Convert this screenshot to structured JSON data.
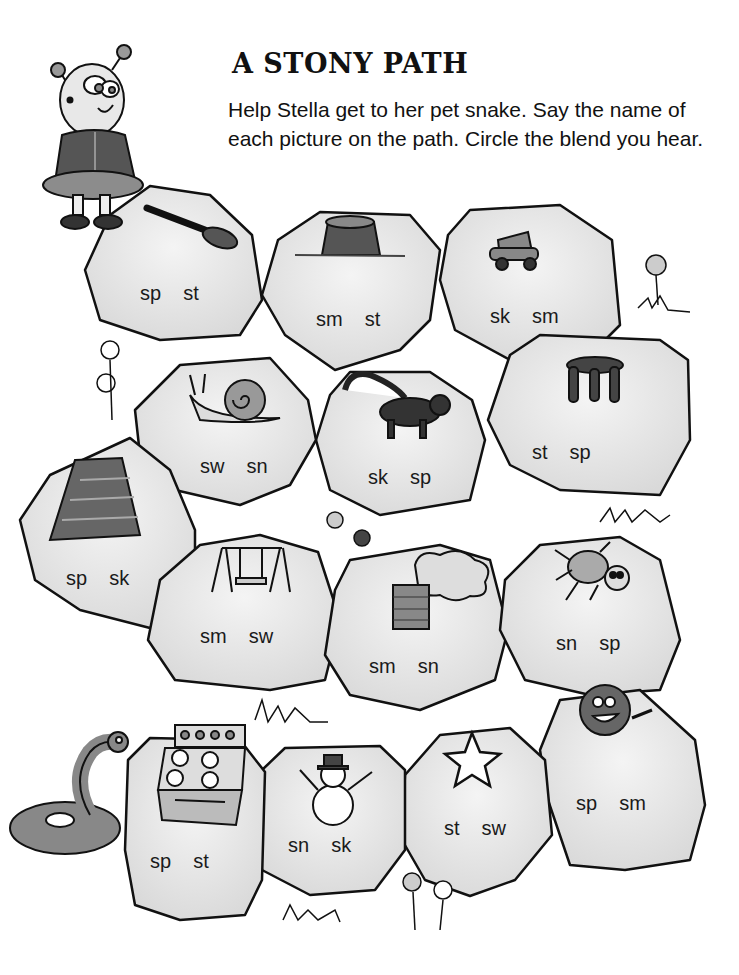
{
  "worksheet": {
    "title": "A STONY PATH",
    "instructions": "Help Stella get to her pet snake. Say the name of each picture on the path. Circle the blend you hear.",
    "characters": {
      "start": "Stella (girl with antennae)",
      "end": "snake"
    },
    "colors": {
      "stone_fill": "#e8e8e8",
      "stone_outline": "#111111",
      "picture_dark": "#4a4a4a",
      "picture_mid": "#8a8a8a",
      "background": "#ffffff"
    },
    "stones": [
      {
        "picture": "spoon",
        "choices": [
          "sp",
          "st"
        ]
      },
      {
        "picture": "stump",
        "choices": [
          "sm",
          "st"
        ]
      },
      {
        "picture": "skate",
        "choices": [
          "sk",
          "sm"
        ]
      },
      {
        "picture": "stool",
        "choices": [
          "st",
          "sp"
        ]
      },
      {
        "picture": "skunk",
        "choices": [
          "sk",
          "sp"
        ]
      },
      {
        "picture": "snail",
        "choices": [
          "sw",
          "sn"
        ]
      },
      {
        "picture": "skirt",
        "choices": [
          "sp",
          "sk"
        ]
      },
      {
        "picture": "swing",
        "choices": [
          "sm",
          "sw"
        ]
      },
      {
        "picture": "smoke",
        "choices": [
          "sm",
          "sn"
        ]
      },
      {
        "picture": "spider",
        "choices": [
          "sn",
          "sp"
        ]
      },
      {
        "picture": "smile",
        "choices": [
          "sp",
          "sm"
        ]
      },
      {
        "picture": "star",
        "choices": [
          "st",
          "sw"
        ]
      },
      {
        "picture": "snowman",
        "choices": [
          "sn",
          "sk"
        ]
      },
      {
        "picture": "stove",
        "choices": [
          "sp",
          "st"
        ]
      }
    ]
  }
}
